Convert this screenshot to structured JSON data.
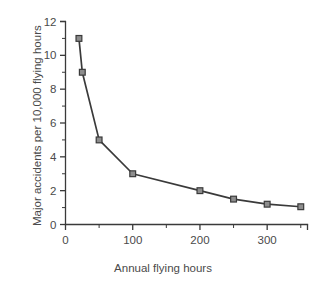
{
  "chart_data": {
    "type": "line",
    "title": "",
    "subtitle": "",
    "xlabel": "Annual flying hours",
    "ylabel": "Major accidents per 10,000 flying hours",
    "xlim": [
      0,
      360
    ],
    "ylim": [
      0,
      12
    ],
    "grid": false,
    "legend": null,
    "x_ticks_major": [
      0,
      100,
      200,
      300
    ],
    "x_tick_labels": [
      "0",
      "100",
      "200",
      "300"
    ],
    "x_ticks_minor": [
      50,
      150,
      250,
      350
    ],
    "y_ticks_major": [
      0,
      2,
      4,
      6,
      8,
      10,
      12
    ],
    "y_tick_labels": [
      "0",
      "2",
      "4",
      "6",
      "8",
      "10",
      "12"
    ],
    "y_ticks_minor": [
      1,
      3,
      5,
      7,
      9,
      11
    ],
    "marker": "square",
    "series": [
      {
        "name": "Major accident rate",
        "x": [
          20,
          25,
          50,
          100,
          200,
          250,
          300,
          350
        ],
        "values": [
          11.0,
          9.0,
          5.0,
          3.0,
          2.0,
          1.5,
          1.2,
          1.05
        ]
      }
    ]
  },
  "colors": {
    "line": "#3a3a3a",
    "marker_fill": "#8d8d8d",
    "marker_edge": "#3a3a3a",
    "axis": "#3a3a3a",
    "text": "#4a4a4a",
    "background": "#ffffff"
  }
}
